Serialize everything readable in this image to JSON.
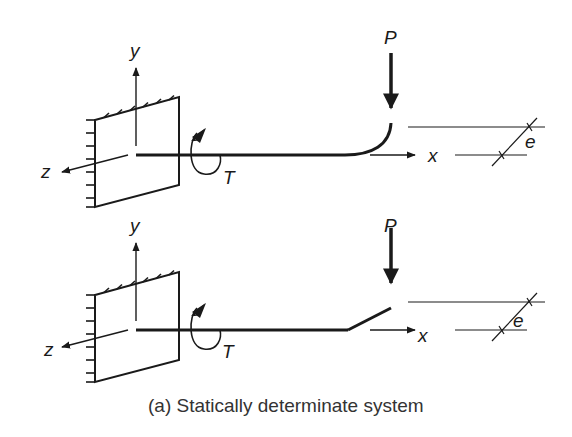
{
  "figure": {
    "caption": "(a) Statically determinate system",
    "colors": {
      "ink": "#1a1a1a",
      "caption": "#333333",
      "background": "#ffffff"
    },
    "panels": [
      {
        "name": "curved-tip-beam",
        "labels": {
          "y_axis": "y",
          "z_axis": "z",
          "x_axis": "x",
          "torque": "T",
          "load": "P",
          "eccentricity": "e"
        },
        "beam_end": "curved"
      },
      {
        "name": "kinked-tip-beam",
        "labels": {
          "y_axis": "y",
          "z_axis": "z",
          "x_axis": "x",
          "torque": "T",
          "load": "P",
          "eccentricity": "e"
        },
        "beam_end": "straight-kink"
      }
    ]
  }
}
